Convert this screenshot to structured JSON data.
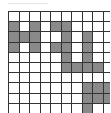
{
  "puzzle": {
    "rows": 10,
    "cols": 10,
    "filled_color": "#8a8a8a",
    "empty_color": "#ffffff",
    "line_color": "#333333",
    "filled": [
      [],
      [
        0,
        2,
        4,
        5
      ],
      [
        0,
        1,
        2,
        5,
        7
      ],
      [
        0,
        2,
        4,
        5,
        7
      ],
      [
        5,
        7
      ],
      [
        5,
        6,
        7,
        8
      ],
      [],
      [
        7,
        8,
        9
      ],
      [
        7,
        8,
        9
      ],
      [
        7
      ]
    ]
  }
}
